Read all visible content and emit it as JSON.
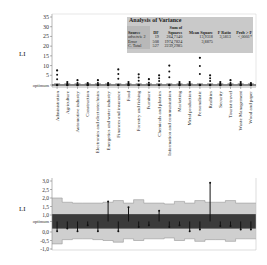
{
  "chart_data": [
    {
      "type": "scatter",
      "title": "",
      "ylabel": "LI",
      "xlabel": "",
      "ylim": [
        -2,
        35
      ],
      "y_ticks": [
        "35",
        "30",
        "25",
        "20",
        "15",
        "10",
        "5",
        "optimum"
      ],
      "categories": [
        "Administration",
        "Agriculture",
        "Automotive industry",
        "Construction",
        "Electronics and electrotechnics",
        "Energetics and water industry",
        "Finances and insurance",
        "Food",
        "Forestry and fishing",
        "Furniture",
        "Chemicals and plastics",
        "Information and communication",
        "Marketing",
        "Metal production",
        "Personalistic",
        "Realities",
        "Security",
        "Tourist travel",
        "Waste Management",
        "Wood and paper"
      ],
      "max_values": [
        7.5,
        1.5,
        2.5,
        1,
        2.5,
        1,
        8,
        1.5,
        5.5,
        3,
        5,
        10,
        1.5,
        1.5,
        14,
        5,
        1.5,
        2.5,
        1.5,
        1
      ],
      "annotation": {
        "title": "Analysis of Variance",
        "columns": [
          "Source",
          "DF",
          "Sum of Squares",
          "Mean Square",
          "F Ratio",
          "Prob > F"
        ],
        "rows": [
          [
            "odvetvie 2",
            "19",
            "264,7140",
            "13,9318",
            "3,5813",
            "<,0001*"
          ],
          [
            "Error",
            "508",
            "1974,7824",
            "3,8875",
            "",
            ""
          ],
          [
            "C. Total",
            "527",
            "2239,2985",
            "",
            "",
            ""
          ]
        ]
      }
    },
    {
      "type": "bar",
      "title": "",
      "ylabel": "LI",
      "ylim": [
        -1.0,
        3.0
      ],
      "y_ticks": [
        "3,0",
        "2,5",
        "2,0",
        "1,5",
        "1,0",
        "optimum",
        "0,0",
        "-0,5",
        "-1,0"
      ],
      "optimum_band": [
        0.2,
        1.05
      ],
      "control_limits_upper": [
        2.0,
        1.75,
        1.7,
        1.7,
        1.7,
        1.75,
        1.85,
        1.7,
        1.9,
        1.7,
        1.7,
        1.65,
        1.8,
        1.7,
        1.85,
        1.75,
        1.75,
        1.85,
        1.7,
        1.7
      ],
      "control_limits_lower": [
        -0.7,
        -0.45,
        -0.4,
        -0.4,
        -0.45,
        -0.5,
        -0.6,
        -0.4,
        -0.5,
        -0.4,
        -0.4,
        -0.35,
        -0.5,
        -0.4,
        -0.55,
        -0.45,
        -0.45,
        -0.55,
        -0.4,
        -0.4
      ],
      "values": [
        0.05,
        0.2,
        0.05,
        0.4,
        0.05,
        1.8,
        0.05,
        1.45,
        0.3,
        0.4,
        1.25,
        0.3,
        0.4,
        0.05,
        0.15,
        2.9,
        0.35,
        0.35,
        0.15,
        0.15
      ]
    }
  ],
  "top": {
    "ylabel": "LI",
    "anova": {
      "title": "Analysis of Variance",
      "sum_of": "Sum of",
      "headers": [
        "Source",
        "DF",
        "Squares",
        "Mean Square",
        "F Ratio",
        "Prob > F"
      ],
      "r1": [
        "odvetvie 2",
        "19",
        "264,7140",
        "13,9318",
        "3,5813",
        "<,0001*"
      ],
      "r2": [
        "Error",
        "508",
        "1974,7824",
        "3,8875"
      ],
      "r3": [
        "C. Total",
        "527",
        "2239,2985"
      ]
    }
  },
  "bottom": {
    "ylabel": "LI"
  }
}
